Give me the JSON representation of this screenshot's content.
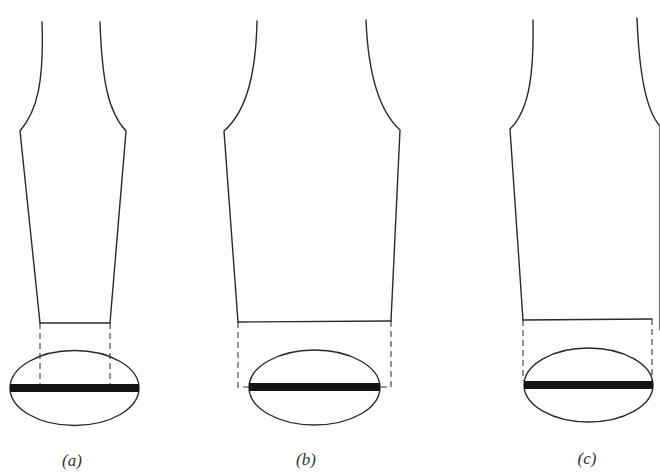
{
  "diagram": {
    "width": 660,
    "height": 474,
    "colors": {
      "background": "#ffffff",
      "stroke": "#2a2a2a",
      "bar": "#141414",
      "label": "#333333"
    },
    "figures": [
      {
        "id": "a",
        "label": "(a)",
        "label_pos": [
          72,
          461
        ],
        "outline_left": "M 42 22 C 44 80, 38 110, 20 131 L 40 323",
        "outline_right": "M 100 22 C 102 80, 108 112, 126 131 L 110 323",
        "bottom_edge": [
          [
            40,
            323
          ],
          [
            110,
            323
          ]
        ],
        "dashed_lines": [
          "M 40 323 L 40 384",
          "M 110 323 L 110 384"
        ],
        "ellipse": {
          "cx": 74.5,
          "cy": 388,
          "rx": 64.5,
          "ry": 37.5
        },
        "bar": {
          "x": 10,
          "y": 384,
          "width": 129,
          "height": 8
        }
      },
      {
        "id": "b",
        "label": "(b)",
        "label_pos": [
          306,
          460
        ],
        "outline_left": "M 257 21 C 256 70, 248 110, 224 131 L 238 322",
        "outline_right": "M 366 20 C 368 70, 378 110, 400 130 L 391 321",
        "bottom_edge": [
          [
            238,
            322
          ],
          [
            391,
            321
          ]
        ],
        "dashed_lines": [
          "M 238 322 L 238 387 L 249 387",
          "M 391 321 L 391 387 L 381 387"
        ],
        "ellipse": {
          "cx": 314.5,
          "cy": 387.5,
          "rx": 65.5,
          "ry": 37.5
        },
        "bar": {
          "x": 249,
          "y": 383,
          "width": 131,
          "height": 8
        }
      },
      {
        "id": "c",
        "label": "(c)",
        "label_pos": [
          587,
          459
        ],
        "outline_left": "M 533 20 C 534 70, 530 110, 510 129 L 523 320",
        "outline_right": "M 637 18 C 639 70, 645 110, 660 126 L 660 330",
        "bottom_edge": [
          [
            523,
            320
          ],
          [
            652,
            319
          ]
        ],
        "dashed_lines": [
          "M 523 320 L 523 381",
          "M 652 319 L 652 381"
        ],
        "ellipse": {
          "cx": 588.5,
          "cy": 385,
          "rx": 64.5,
          "ry": 37
        },
        "bar": {
          "x": 524,
          "y": 381,
          "width": 129,
          "height": 8
        }
      }
    ]
  }
}
